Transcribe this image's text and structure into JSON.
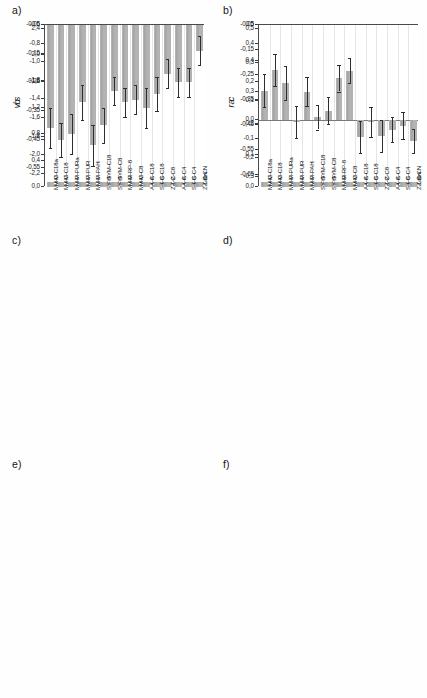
{
  "figure": {
    "width": 427,
    "height": 698,
    "bar_color": "#a8a8a8",
    "error_color": "#2e2e2e",
    "axis_color": "#4a4a4a",
    "background": "#ffffff"
  },
  "categories": [
    "M-C18a",
    "M-C18",
    "M-PURa",
    "M-PUR",
    "M-PAH",
    "SYM-C18",
    "SYM-C8",
    "M-RP-8",
    "M-C8",
    "A-C18",
    "S-C18",
    "Z-C8",
    "A-C4",
    "S-C4",
    "Z-CN"
  ],
  "panels": [
    {
      "letter": "a)",
      "ylabel": "v",
      "ytick_labels": [
        "2,4",
        "2,0",
        "1,6",
        "1,2",
        "0,8",
        "0,4",
        "0,0"
      ]
    },
    {
      "letter": "b)",
      "ylabel": "r",
      "ytick_labels": [
        "0,5",
        "0,4",
        "0,3",
        "0,2",
        "0,1",
        "0,0"
      ]
    },
    {
      "letter": "c)",
      "ylabel": "b",
      "ytick_labels": [
        "-0,6",
        "-0,8",
        "-1,0",
        "-1,2",
        "-1,4",
        "-1,6",
        "-1,8",
        "-2,0",
        "-2,2"
      ]
    },
    {
      "letter": "d)",
      "ylabel": "a",
      "ytick_labels": [
        "-0,05",
        "-0,15",
        "-0,25",
        "-0,35",
        "-0,45",
        "-0,55",
        "-0,65"
      ]
    },
    {
      "letter": "e)",
      "ylabel": "s",
      "ytick_labels": [
        "-0,05",
        "-0,15",
        "-0,25",
        "-0,35",
        "-0,45",
        "-0,55"
      ]
    },
    {
      "letter": "f)",
      "ylabel": "c",
      "ytick_labels": [
        "0,5",
        "0,4",
        "0,3",
        "0,2",
        "0,1",
        "0,0",
        "-0,1",
        "-0,2",
        "-0,3"
      ]
    }
  ],
  "chart_data": [
    {
      "type": "bar",
      "panel": "a",
      "title": "a)",
      "xlabel": "",
      "ylabel": "v",
      "ylim": [
        0.0,
        2.4
      ],
      "yticks": [
        0.0,
        0.4,
        0.8,
        1.2,
        1.6,
        2.0,
        2.4
      ],
      "grid": true,
      "baseline": 0.0,
      "categories": [
        "M-C18a",
        "M-C18",
        "M-PURa",
        "M-PUR",
        "M-PAH",
        "SYM-C18",
        "SYM-C8",
        "M-RP-8",
        "M-C8",
        "A-C18",
        "S-C18",
        "Z-C8",
        "A-C4",
        "S-C4",
        "Z-CN"
      ],
      "values": [
        1.95,
        1.82,
        1.95,
        1.87,
        1.73,
        2.0,
        1.87,
        1.59,
        1.54,
        1.6,
        1.33,
        1.21,
        1.15,
        1.13,
        0.8
      ],
      "errors": [
        0.09,
        0.08,
        0.09,
        0.1,
        0.07,
        0.07,
        0.07,
        0.06,
        0.07,
        0.08,
        0.06,
        0.04,
        0.05,
        0.05,
        0.07
      ]
    },
    {
      "type": "bar",
      "panel": "b",
      "title": "b)",
      "xlabel": "",
      "ylabel": "r",
      "ylim": [
        0.0,
        0.5
      ],
      "yticks": [
        0.0,
        0.1,
        0.2,
        0.3,
        0.4,
        0.5
      ],
      "grid": true,
      "baseline": 0.0,
      "categories": [
        "M-C18a",
        "M-C18",
        "M-PURa",
        "M-PUR",
        "M-PAH",
        "SYM-C18",
        "SYM-C8",
        "M-RP-8",
        "M-C8",
        "A-C18",
        "S-C18",
        "Z-C8",
        "A-C4",
        "S-C4",
        "Z-CN"
      ],
      "values": [
        0.3,
        0.26,
        0.31,
        0.27,
        0.28,
        0.385,
        0.33,
        0.235,
        0.21,
        0.225,
        0.185,
        0.155,
        0.15,
        0.145,
        0.15
      ],
      "errors": [
        0.07,
        0.065,
        0.07,
        0.075,
        0.06,
        0.055,
        0.055,
        0.05,
        0.045,
        0.06,
        0.055,
        0.045,
        0.045,
        0.05,
        0.05
      ]
    },
    {
      "type": "bar",
      "panel": "c",
      "title": "c)",
      "xlabel": "",
      "ylabel": "b",
      "ylim": [
        -2.3,
        -0.6
      ],
      "yticks": [
        -2.2,
        -2.0,
        -1.8,
        -1.6,
        -1.4,
        -1.2,
        -1.0,
        -0.8,
        -0.6
      ],
      "grid": true,
      "baseline": -0.6,
      "categories": [
        "M-C18a",
        "M-C18",
        "M-PURa",
        "M-PUR",
        "M-PAH",
        "SYM-C18",
        "SYM-C8",
        "M-RP-8",
        "M-C8",
        "A-C18",
        "S-C18",
        "Z-C8",
        "A-C4",
        "S-C4",
        "Z-CN"
      ],
      "values": [
        -1.9,
        -1.81,
        -1.91,
        -2.02,
        -1.56,
        -2.05,
        -1.94,
        -1.56,
        -1.5,
        -1.57,
        -1.25,
        -1.14,
        -1.04,
        -1.05,
        -0.88
      ],
      "errors": [
        0.12,
        0.1,
        0.12,
        0.13,
        0.08,
        0.1,
        0.1,
        0.07,
        0.06,
        0.08,
        0.1,
        0.07,
        0.07,
        0.07,
        0.08
      ]
    },
    {
      "type": "bar",
      "panel": "d",
      "title": "d)",
      "xlabel": "",
      "ylabel": "a",
      "ylim": [
        -0.68,
        -0.05
      ],
      "yticks": [
        -0.65,
        -0.55,
        -0.45,
        -0.35,
        -0.25,
        -0.15,
        -0.05
      ],
      "grid": true,
      "baseline": -0.05,
      "categories": [
        "M-C18a",
        "M-C18",
        "M-PURa",
        "M-PUR",
        "M-PAH",
        "SYM-C18",
        "SYM-C8",
        "M-RP-8",
        "M-C8",
        "A-C18",
        "S-C18",
        "Z-C8",
        "A-C4",
        "S-C4",
        "Z-CN"
      ],
      "values": [
        -0.54,
        -0.53,
        -0.57,
        -0.54,
        -0.5,
        -0.41,
        -0.29,
        -0.53,
        -0.46,
        -0.45,
        -0.42,
        -0.31,
        -0.29,
        -0.29,
        -0.14
      ],
      "errors": [
        0.07,
        0.06,
        0.07,
        0.08,
        0.06,
        0.05,
        0.05,
        0.06,
        0.05,
        0.06,
        0.06,
        0.05,
        0.06,
        0.06,
        0.05
      ]
    },
    {
      "type": "bar",
      "panel": "e",
      "title": "e)",
      "xlabel": "",
      "ylabel": "s",
      "ylim": [
        -0.58,
        -0.05
      ],
      "yticks": [
        -0.55,
        -0.45,
        -0.35,
        -0.25,
        -0.15,
        -0.05
      ],
      "grid": true,
      "baseline": -0.05,
      "categories": [
        "M-C18a",
        "M-C18",
        "M-PURa",
        "M-PUR",
        "M-PAH",
        "SYM-C18",
        "SYM-C8",
        "M-RP-8",
        "M-C8",
        "A-C18",
        "S-C18",
        "Z-C8",
        "A-C4",
        "S-C4",
        "Z-CN"
      ],
      "values": [
        -0.41,
        -0.45,
        -0.43,
        -0.32,
        -0.47,
        -0.4,
        -0.28,
        -0.32,
        -0.31,
        -0.34,
        -0.29,
        -0.22,
        -0.25,
        -0.25,
        -0.14
      ],
      "errors": [
        0.07,
        0.06,
        0.07,
        0.06,
        0.07,
        0.06,
        0.05,
        0.05,
        0.05,
        0.07,
        0.06,
        0.05,
        0.05,
        0.05,
        0.05
      ]
    },
    {
      "type": "bar",
      "panel": "f",
      "title": "f)",
      "xlabel": "",
      "ylabel": "c",
      "ylim": [
        -0.3,
        0.5
      ],
      "yticks": [
        -0.3,
        -0.2,
        -0.1,
        0.0,
        0.1,
        0.2,
        0.3,
        0.4,
        0.5
      ],
      "grid": true,
      "baseline": 0.0,
      "categories": [
        "M-C18a",
        "M-C18",
        "M-PURa",
        "M-PUR",
        "M-PAH",
        "SYM-C18",
        "SYM-C8",
        "M-RP-8",
        "M-C8",
        "A-C18",
        "S-C18",
        "Z-C8",
        "A-C4",
        "S-C4",
        "Z-CN"
      ],
      "values": [
        0.155,
        0.265,
        0.195,
        -0.01,
        0.15,
        0.015,
        0.05,
        0.22,
        0.26,
        -0.09,
        -0.01,
        -0.085,
        -0.05,
        -0.03,
        -0.11
      ],
      "errors": [
        0.085,
        0.085,
        0.09,
        0.085,
        0.075,
        0.065,
        0.07,
        0.07,
        0.065,
        0.085,
        0.08,
        0.085,
        0.065,
        0.07,
        0.065
      ]
    }
  ]
}
